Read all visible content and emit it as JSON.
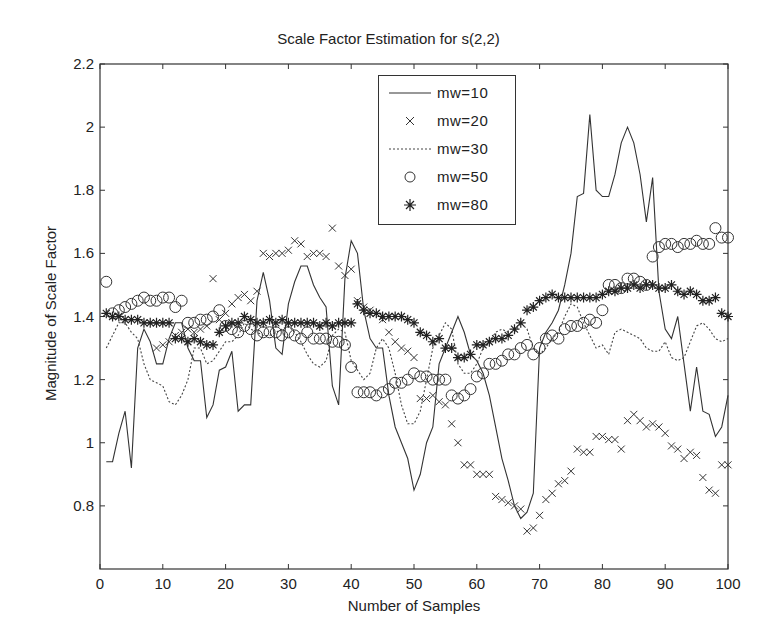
{
  "chart_data": {
    "type": "line",
    "title": "Scale Factor Estimation for s(2,2)",
    "xlabel": "Number of Samples",
    "ylabel": "Magnitude of Scale Factor",
    "xlim": [
      0,
      100
    ],
    "ylim": [
      0.6,
      2.2
    ],
    "xticks": [
      0,
      10,
      20,
      30,
      40,
      50,
      60,
      70,
      80,
      90,
      100
    ],
    "yticks": [
      0.8,
      1,
      1.2,
      1.4,
      1.6,
      1.8,
      2,
      2.2
    ],
    "grid": false,
    "legend_position": "upper center",
    "series": [
      {
        "name": "mw=10",
        "style": "solid-line",
        "x": [
          1,
          2,
          3,
          4,
          5,
          6,
          7,
          8,
          9,
          10,
          11,
          12,
          13,
          14,
          15,
          16,
          17,
          18,
          19,
          20,
          21,
          22,
          23,
          24,
          25,
          26,
          27,
          28,
          29,
          30,
          31,
          32,
          33,
          34,
          35,
          36,
          37,
          38,
          39,
          40,
          41,
          42,
          43,
          44,
          45,
          46,
          47,
          48,
          49,
          50,
          51,
          52,
          53,
          54,
          55,
          56,
          57,
          58,
          59,
          60,
          61,
          62,
          63,
          64,
          65,
          66,
          67,
          68,
          69,
          70,
          71,
          72,
          73,
          74,
          75,
          76,
          77,
          78,
          79,
          80,
          81,
          82,
          83,
          84,
          85,
          86,
          87,
          88,
          89,
          90,
          91,
          92,
          93,
          94,
          95,
          96,
          97,
          98,
          99,
          100
        ],
        "values": [
          0.94,
          0.94,
          1.03,
          1.1,
          0.92,
          1.3,
          1.36,
          1.32,
          1.25,
          1.25,
          1.33,
          1.38,
          1.38,
          1.3,
          1.26,
          1.26,
          1.08,
          1.12,
          1.23,
          1.24,
          1.29,
          1.1,
          1.12,
          1.12,
          1.45,
          1.54,
          1.45,
          1.3,
          1.28,
          1.44,
          1.51,
          1.56,
          1.56,
          1.5,
          1.46,
          1.43,
          1.18,
          1.12,
          1.52,
          1.64,
          1.6,
          1.42,
          1.33,
          1.3,
          1.3,
          1.15,
          1.05,
          1.0,
          0.95,
          0.85,
          0.9,
          1.0,
          1.05,
          1.25,
          1.3,
          1.35,
          1.4,
          1.35,
          1.28,
          1.26,
          1.22,
          1.15,
          1.05,
          0.95,
          0.88,
          0.8,
          0.76,
          0.78,
          0.84,
          1.3,
          1.35,
          1.38,
          1.42,
          1.5,
          1.6,
          1.78,
          1.79,
          2.04,
          1.8,
          1.78,
          1.78,
          1.85,
          1.95,
          2.0,
          1.95,
          1.85,
          1.7,
          1.84,
          1.48,
          1.36,
          1.33,
          1.4,
          1.25,
          1.1,
          1.24,
          1.1,
          1.09,
          1.02,
          1.05,
          1.15
        ],
        "color": "#333333"
      },
      {
        "name": "mw=20",
        "style": "x-marker",
        "x": [
          9,
          10,
          11,
          12,
          13,
          14,
          15,
          16,
          17,
          18,
          19,
          20,
          21,
          22,
          23,
          24,
          25,
          26,
          27,
          28,
          29,
          30,
          31,
          32,
          33,
          34,
          35,
          36,
          37,
          38,
          39,
          40,
          41,
          42,
          43,
          44,
          45,
          46,
          47,
          48,
          49,
          50,
          51,
          52,
          53,
          54,
          55,
          56,
          57,
          58,
          59,
          60,
          61,
          62,
          63,
          64,
          65,
          66,
          67,
          68,
          69,
          70,
          71,
          72,
          73,
          74,
          75,
          76,
          77,
          78,
          79,
          80,
          81,
          82,
          83,
          84,
          85,
          86,
          87,
          88,
          89,
          90,
          91,
          92,
          93,
          94,
          95,
          96,
          97,
          98,
          99,
          100
        ],
        "values": [
          1.3,
          1.31,
          1.32,
          1.34,
          1.35,
          1.36,
          1.35,
          1.36,
          1.37,
          1.52,
          1.39,
          1.41,
          1.44,
          1.46,
          1.47,
          1.45,
          1.48,
          1.6,
          1.59,
          1.6,
          1.6,
          1.61,
          1.64,
          1.63,
          1.59,
          1.6,
          1.6,
          1.59,
          1.68,
          1.56,
          1.53,
          1.55,
          1.45,
          1.43,
          1.42,
          1.41,
          1.39,
          1.35,
          1.32,
          1.3,
          1.29,
          1.27,
          1.14,
          1.14,
          1.15,
          1.13,
          1.12,
          1.06,
          1.0,
          0.93,
          0.93,
          0.9,
          0.9,
          0.9,
          0.83,
          0.82,
          0.81,
          0.8,
          0.79,
          0.72,
          0.73,
          0.77,
          0.82,
          0.84,
          0.87,
          0.88,
          0.91,
          0.98,
          0.97,
          0.97,
          1.02,
          1.02,
          1.01,
          1.01,
          0.98,
          1.07,
          1.09,
          1.07,
          1.05,
          1.06,
          1.05,
          1.03,
          0.99,
          0.98,
          0.95,
          0.97,
          0.96,
          0.89,
          0.85,
          0.84,
          0.93,
          0.93
        ],
        "color": "#333333"
      },
      {
        "name": "mw=30",
        "style": "dotted-line",
        "x": [
          1,
          2,
          3,
          4,
          5,
          6,
          7,
          8,
          9,
          10,
          11,
          12,
          13,
          14,
          15,
          16,
          17,
          18,
          19,
          20,
          21,
          22,
          23,
          24,
          25,
          26,
          27,
          28,
          29,
          30,
          31,
          32,
          33,
          34,
          35,
          36,
          37,
          38,
          39,
          40,
          41,
          42,
          43,
          44,
          45,
          46,
          47,
          48,
          49,
          50,
          51,
          52,
          53,
          54,
          55,
          56,
          57,
          58,
          59,
          60,
          61,
          62,
          63,
          64,
          65,
          66,
          67,
          68,
          69,
          70,
          71,
          72,
          73,
          74,
          75,
          76,
          77,
          78,
          79,
          80,
          81,
          82,
          83,
          84,
          85,
          86,
          87,
          88,
          89,
          90,
          91,
          92,
          93,
          94,
          95,
          96,
          97,
          98,
          99,
          100
        ],
        "values": [
          1.3,
          1.34,
          1.38,
          1.38,
          1.35,
          1.33,
          1.25,
          1.2,
          1.19,
          1.18,
          1.13,
          1.12,
          1.15,
          1.2,
          1.3,
          1.3,
          1.25,
          1.26,
          1.29,
          1.32,
          1.32,
          1.34,
          1.38,
          1.36,
          1.35,
          1.34,
          1.34,
          1.35,
          1.36,
          1.37,
          1.35,
          1.32,
          1.28,
          1.25,
          1.24,
          1.26,
          1.34,
          1.36,
          1.35,
          1.26,
          1.23,
          1.2,
          1.22,
          1.3,
          1.33,
          1.3,
          1.22,
          1.12,
          1.06,
          1.06,
          1.1,
          1.2,
          1.3,
          1.34,
          1.38,
          1.36,
          1.25,
          1.22,
          1.22,
          1.25,
          1.3,
          1.32,
          1.35,
          1.36,
          1.35,
          1.35,
          1.38,
          1.36,
          1.3,
          1.28,
          1.3,
          1.33,
          1.35,
          1.4,
          1.44,
          1.43,
          1.38,
          1.34,
          1.3,
          1.31,
          1.28,
          1.35,
          1.36,
          1.35,
          1.34,
          1.33,
          1.3,
          1.29,
          1.29,
          1.32,
          1.27,
          1.26,
          1.27,
          1.32,
          1.37,
          1.38,
          1.36,
          1.33,
          1.32,
          1.33
        ],
        "color": "#444444"
      },
      {
        "name": "mw=50",
        "style": "circle-marker",
        "x": [
          1,
          2,
          3,
          4,
          5,
          6,
          7,
          8,
          9,
          10,
          11,
          12,
          13,
          14,
          15,
          16,
          17,
          18,
          19,
          20,
          21,
          22,
          23,
          24,
          25,
          26,
          27,
          28,
          29,
          30,
          31,
          32,
          33,
          34,
          35,
          36,
          37,
          38,
          39,
          40,
          41,
          42,
          43,
          44,
          45,
          46,
          47,
          48,
          49,
          50,
          51,
          52,
          53,
          54,
          55,
          56,
          57,
          58,
          59,
          60,
          61,
          62,
          63,
          64,
          65,
          66,
          67,
          68,
          69,
          70,
          71,
          72,
          73,
          74,
          75,
          76,
          77,
          78,
          79,
          80,
          81,
          82,
          83,
          84,
          85,
          86,
          87,
          88,
          89,
          90,
          91,
          92,
          93,
          94,
          95,
          96,
          97,
          98,
          99,
          100
        ],
        "values": [
          1.51,
          1.41,
          1.42,
          1.43,
          1.44,
          1.45,
          1.46,
          1.45,
          1.45,
          1.46,
          1.46,
          1.43,
          1.45,
          1.38,
          1.38,
          1.39,
          1.39,
          1.4,
          1.42,
          1.37,
          1.36,
          1.35,
          1.37,
          1.36,
          1.34,
          1.35,
          1.35,
          1.35,
          1.34,
          1.35,
          1.34,
          1.33,
          1.35,
          1.33,
          1.33,
          1.33,
          1.32,
          1.32,
          1.31,
          1.24,
          1.16,
          1.16,
          1.16,
          1.15,
          1.16,
          1.17,
          1.19,
          1.19,
          1.2,
          1.22,
          1.21,
          1.21,
          1.2,
          1.2,
          1.2,
          1.15,
          1.14,
          1.15,
          1.17,
          1.21,
          1.22,
          1.25,
          1.25,
          1.26,
          1.28,
          1.28,
          1.3,
          1.31,
          1.28,
          1.3,
          1.33,
          1.34,
          1.33,
          1.36,
          1.37,
          1.37,
          1.38,
          1.39,
          1.38,
          1.42,
          1.5,
          1.5,
          1.49,
          1.52,
          1.52,
          1.51,
          1.5,
          1.59,
          1.62,
          1.63,
          1.63,
          1.62,
          1.63,
          1.63,
          1.64,
          1.63,
          1.63,
          1.68,
          1.65,
          1.65
        ],
        "color": "#333333"
      },
      {
        "name": "mw=80",
        "style": "star-marker",
        "x": [
          1,
          2,
          3,
          4,
          5,
          6,
          7,
          8,
          9,
          10,
          11,
          12,
          13,
          14,
          15,
          16,
          17,
          18,
          19,
          20,
          21,
          22,
          23,
          24,
          25,
          26,
          27,
          28,
          29,
          30,
          31,
          32,
          33,
          34,
          35,
          36,
          37,
          38,
          39,
          40,
          41,
          42,
          43,
          44,
          45,
          46,
          47,
          48,
          49,
          50,
          51,
          52,
          53,
          54,
          55,
          56,
          57,
          58,
          59,
          60,
          61,
          62,
          63,
          64,
          65,
          66,
          67,
          68,
          69,
          70,
          71,
          72,
          73,
          74,
          75,
          76,
          77,
          78,
          79,
          80,
          81,
          82,
          83,
          84,
          85,
          86,
          87,
          88,
          89,
          90,
          91,
          92,
          93,
          94,
          95,
          96,
          97,
          98,
          99,
          100
        ],
        "values": [
          1.41,
          1.4,
          1.4,
          1.39,
          1.39,
          1.39,
          1.38,
          1.38,
          1.38,
          1.38,
          1.38,
          1.33,
          1.33,
          1.32,
          1.33,
          1.32,
          1.31,
          1.31,
          1.35,
          1.37,
          1.38,
          1.38,
          1.4,
          1.39,
          1.38,
          1.38,
          1.39,
          1.38,
          1.39,
          1.38,
          1.38,
          1.38,
          1.38,
          1.38,
          1.37,
          1.38,
          1.37,
          1.38,
          1.38,
          1.38,
          1.44,
          1.42,
          1.41,
          1.41,
          1.4,
          1.4,
          1.4,
          1.4,
          1.39,
          1.38,
          1.35,
          1.34,
          1.32,
          1.33,
          1.3,
          1.3,
          1.27,
          1.27,
          1.28,
          1.31,
          1.31,
          1.32,
          1.33,
          1.33,
          1.34,
          1.36,
          1.38,
          1.42,
          1.43,
          1.45,
          1.46,
          1.47,
          1.46,
          1.46,
          1.46,
          1.46,
          1.46,
          1.46,
          1.46,
          1.47,
          1.48,
          1.48,
          1.49,
          1.49,
          1.5,
          1.49,
          1.5,
          1.5,
          1.49,
          1.49,
          1.5,
          1.48,
          1.47,
          1.48,
          1.47,
          1.45,
          1.45,
          1.46,
          1.41,
          1.4
        ],
        "color": "#222222"
      }
    ]
  },
  "legend": {
    "items": [
      "mw=10",
      "mw=20",
      "mw=30",
      "mw=50",
      "mw=80"
    ]
  }
}
